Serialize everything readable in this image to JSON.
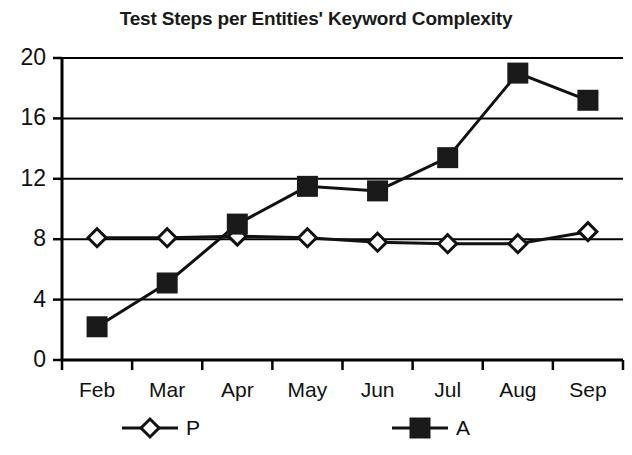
{
  "chart_data": {
    "type": "line",
    "title": "Test Steps per Entities' Keyword Complexity",
    "xlabel": "",
    "ylabel": "",
    "categories": [
      "Feb",
      "Mar",
      "Apr",
      "May",
      "Jun",
      "Jul",
      "Aug",
      "Sep"
    ],
    "series": [
      {
        "name": "P",
        "marker": "open-diamond",
        "values": [
          8.1,
          8.1,
          8.2,
          8.1,
          7.8,
          7.7,
          7.7,
          8.5
        ]
      },
      {
        "name": "A",
        "marker": "filled-square",
        "values": [
          2.2,
          5.1,
          9.0,
          11.5,
          11.2,
          13.4,
          19.0,
          17.2
        ]
      }
    ],
    "ylim": [
      0,
      20
    ],
    "yticks": [
      0,
      4,
      8,
      12,
      16,
      20
    ],
    "ytick_labels": [
      "0",
      "4",
      "8",
      "12",
      "16",
      "20"
    ],
    "grid": "horizontal",
    "legend_position": "bottom",
    "legend": [
      {
        "label": "P",
        "marker": "open-diamond"
      },
      {
        "label": "A",
        "marker": "filled-square"
      }
    ],
    "colors": {
      "line": "#111111",
      "marker_fill_open": "#ffffff",
      "marker_fill_solid": "#1a1a1a",
      "axis": "#000000",
      "background": "#ffffff"
    }
  }
}
